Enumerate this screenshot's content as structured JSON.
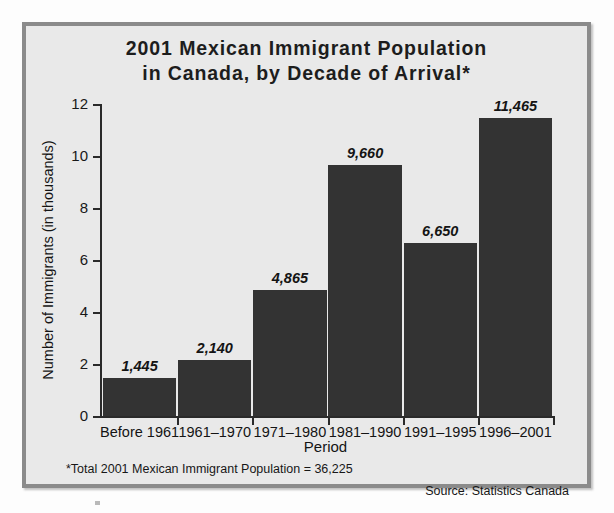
{
  "figure": {
    "title_line_1": "2001 Mexican Immigrant Population",
    "title_line_2": "in Canada, by Decade of Arrival*",
    "footnote": "*Total 2001 Mexican Immigrant Population = 36,225",
    "source": "Source: Statistics Canada",
    "colors": {
      "background": "#e9e9e9",
      "frame_border": "#8b8b8b",
      "bar_fill": "#333333",
      "axis": "#2a2a2a",
      "text": "#141414"
    }
  },
  "chart_data": {
    "type": "bar",
    "title": "2001 Mexican Immigrant Population in Canada, by Decade of Arrival*",
    "xlabel": "Period",
    "ylabel": "Number of Immigrants (in thousands)",
    "categories": [
      "Before 1961",
      "1961–1970",
      "1971–1980",
      "1981–1990",
      "1991–1995",
      "1996–2001"
    ],
    "values": [
      1445,
      2140,
      4865,
      9660,
      6650,
      11465
    ],
    "value_labels": [
      "1,445",
      "2,140",
      "4,865",
      "9,660",
      "6,650",
      "11,465"
    ],
    "values_in_thousands": [
      1.445,
      2.14,
      4.865,
      9.66,
      6.65,
      11.465
    ],
    "ylim": [
      0,
      12
    ],
    "ytick_values": [
      0,
      2,
      4,
      6,
      8,
      10,
      12
    ],
    "ytick_labels": [
      "0",
      "2",
      "4",
      "6",
      "8",
      "10",
      "12"
    ],
    "units": "thousands of immigrants",
    "total": 36225,
    "grid": false,
    "legend": false,
    "legend_position": "none",
    "source": "Statistics Canada"
  }
}
